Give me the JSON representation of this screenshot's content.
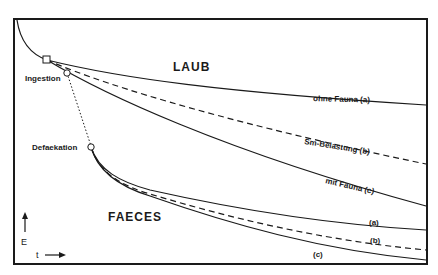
{
  "diagram": {
    "regions": {
      "upper": "LAUB",
      "lower": "FAECES"
    },
    "events": {
      "ingestion": "Ingestion",
      "defaekation": "Defaekation"
    },
    "laub_curves": {
      "a": "ohne Fauna (a)",
      "b": "Sm-Belastung (b)",
      "c": "mit Fauna (c)"
    },
    "faeces_curves": {
      "a": "(a)",
      "b": "(b)",
      "c": "(c)"
    },
    "axes": {
      "y": "E",
      "x": "t"
    },
    "colors": {
      "ink": "#1a1a1a",
      "background": "#ffffff"
    }
  }
}
